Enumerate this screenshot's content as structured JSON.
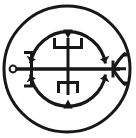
{
  "image": {
    "kind": "occult-sigil-line-art",
    "title": "Goetic Seal Sigil",
    "background_color": "#ffffff",
    "ink_color": "#171717",
    "width": 136,
    "height": 138
  },
  "sigil": {
    "name": "sigil-seal",
    "description": "Circular occult seal: an outer ring enclosing two opposed arcs, a horizontal spear-like bar with a small ring on the left and a crow's-foot arrowhead on the right, and a vertical stem bearing an upright trident above and an inverted trident below.",
    "outer_ring": {
      "name": "outer-ring",
      "center_x": 67,
      "center_y": 69,
      "radius": 63,
      "stroke_width": 3
    },
    "upper_arc": {
      "name": "upper-arc",
      "center_x": 68,
      "center_y": 69,
      "radius": 38,
      "start_angle_deg": 188,
      "end_angle_deg": 352,
      "stroke_width": 3.2,
      "arrowheads": [
        "left-tip-inward",
        "top-center-inward",
        "right-tip-inward"
      ]
    },
    "lower_arc": {
      "name": "lower-arc",
      "center_x": 68,
      "center_y": 69,
      "radius": 38,
      "start_angle_deg": 8,
      "end_angle_deg": 172,
      "stroke_width": 3.2,
      "arrowheads": [
        "right-tip-inward",
        "bottom-center-inward",
        "left-tip-inward"
      ]
    },
    "horizontal_bar": {
      "name": "horizontal-spear-bar",
      "x1": 16,
      "x2": 124,
      "y": 69,
      "stroke_width": 3.4
    },
    "left_terminal": {
      "name": "left-ring-terminal",
      "type": "small-open-circle",
      "center_x": 13,
      "center_y": 69,
      "radius": 3.4,
      "stroke_width": 2
    },
    "left_bracket": {
      "name": "left-bracket-staple",
      "type": "open-left-staple",
      "x": 30,
      "top_y": 52,
      "bottom_y": 86,
      "arm_length": 7,
      "stroke_width": 3
    },
    "right_terminal": {
      "name": "right-crowsfoot-arrowhead",
      "type": "three-pronged-curved-barb",
      "apex_x": 113,
      "apex_y": 69,
      "barb_count": 3,
      "stroke_width": 3
    },
    "upper_trident": {
      "name": "upper-trident-glyph",
      "type": "psi-trident-upright",
      "center_x": 68,
      "crossbar_y": 47,
      "top_y": 38,
      "half_width": 15,
      "stroke_width": 3
    },
    "lower_trident": {
      "name": "lower-trident-glyph",
      "type": "psi-trident-inverted",
      "center_x": 68,
      "crossbar_y": 83,
      "bottom_y": 94,
      "half_width": 11,
      "stroke_width": 3
    },
    "vertical_stem": {
      "name": "vertical-stem",
      "x": 68,
      "y1": 38,
      "y2": 95,
      "stroke_width": 3
    }
  }
}
